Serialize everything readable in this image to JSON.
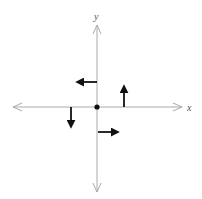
{
  "diagram": {
    "axes": {
      "x_label": "x",
      "y_label": "y",
      "origin": [
        97,
        107
      ],
      "axis_color": "#aaaaaa"
    },
    "origin_point": {
      "color": "#111111"
    },
    "vectors": [
      {
        "name": "left-arrow",
        "at": "positive y-axis",
        "direction": "left"
      },
      {
        "name": "up-arrow",
        "at": "positive x-axis",
        "direction": "up"
      },
      {
        "name": "down-arrow",
        "at": "negative x-axis",
        "direction": "down"
      },
      {
        "name": "right-arrow",
        "at": "negative y-axis",
        "direction": "right"
      }
    ],
    "vector_color": "#111111"
  }
}
